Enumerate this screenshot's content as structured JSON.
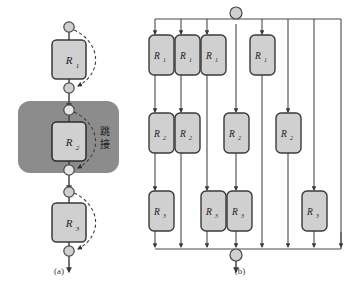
{
  "figure": {
    "title_caption": "",
    "panels": [
      {
        "id": "a",
        "label": "(a)"
      },
      {
        "id": "b",
        "label": "(b)"
      }
    ],
    "colors": {
      "box_fill": "#d0d0d0",
      "box_stroke": "#3a3a3a",
      "node_fill": "#cfcfcf",
      "node_stroke": "#555555",
      "wire": "#4a4a4a",
      "dashed_arrow": "#555555",
      "highlight_block": "#8c8c8c",
      "background": "#ffffff"
    }
  },
  "panel_a": {
    "label": "(a)",
    "annotation": "跳接",
    "blocks": [
      {
        "name": "R1",
        "label": "R",
        "sub": "1"
      },
      {
        "name": "R2",
        "label": "R",
        "sub": "2"
      },
      {
        "name": "R3",
        "label": "R",
        "sub": "3"
      }
    ],
    "nodes_count": 6,
    "skip_connections": 3,
    "highlight_target": "R2"
  },
  "panel_b": {
    "label": "(b)",
    "top_node": "input-node",
    "bottom_node": "output-node",
    "rows": [
      {
        "row": "row-1",
        "blocks": [
          {
            "name": "R1-a",
            "label": "R",
            "sub": "1"
          },
          {
            "name": "R1-b",
            "label": "R",
            "sub": "1"
          },
          {
            "name": "R1-c",
            "label": "R",
            "sub": "1"
          },
          {
            "name": "R1-d",
            "label": "R",
            "sub": "1"
          }
        ]
      },
      {
        "row": "row-2",
        "blocks": [
          {
            "name": "R2-a",
            "label": "R",
            "sub": "2"
          },
          {
            "name": "R2-b",
            "label": "R",
            "sub": "2"
          },
          {
            "name": "R2-c",
            "label": "R",
            "sub": "2"
          },
          {
            "name": "R2-d",
            "label": "R",
            "sub": "2"
          }
        ]
      },
      {
        "row": "row-3",
        "blocks": [
          {
            "name": "R3-a",
            "label": "R",
            "sub": "3"
          },
          {
            "name": "R3-b",
            "label": "R",
            "sub": "3"
          },
          {
            "name": "R3-c",
            "label": "R",
            "sub": "3"
          },
          {
            "name": "R3-d",
            "label": "R",
            "sub": "3"
          }
        ]
      }
    ],
    "paths_count": 8
  },
  "labels": {
    "R": "R",
    "sub1": "1",
    "sub2": "2",
    "sub3": "3",
    "skip": "跳接",
    "panel_a": "(a)",
    "panel_b": "(b)"
  }
}
